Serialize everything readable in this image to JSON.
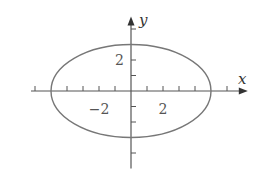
{
  "chart_data": {
    "type": "line",
    "title": "",
    "equation": "x^2/25 + y^2/9 = 1",
    "series": [
      {
        "name": "ellipse",
        "center": [
          0,
          0
        ],
        "semi_axis_x": 5,
        "semi_axis_y": 3,
        "color": "#777777"
      }
    ],
    "xlabel": "x",
    "ylabel": "y",
    "xlim": [
      -6,
      7.3
    ],
    "ylim": [
      -5,
      4.8
    ],
    "x_ticks": [
      -6,
      -4,
      -3,
      -2,
      -1,
      1,
      2,
      3,
      4,
      6
    ],
    "y_ticks": [
      -4,
      -2,
      -1,
      1,
      2,
      4
    ],
    "x_tick_labels": [
      {
        "value": -2,
        "label": "−2"
      },
      {
        "value": 2,
        "label": "2"
      }
    ],
    "y_tick_labels": [
      {
        "value": 2,
        "label": "2"
      }
    ],
    "grid": false,
    "legend": null
  },
  "layout": {
    "origin_px": [
      131,
      91
    ],
    "unit_px_x": 16,
    "unit_px_y": 15.5,
    "axis_color": "#555555",
    "curve_color": "#777777"
  }
}
